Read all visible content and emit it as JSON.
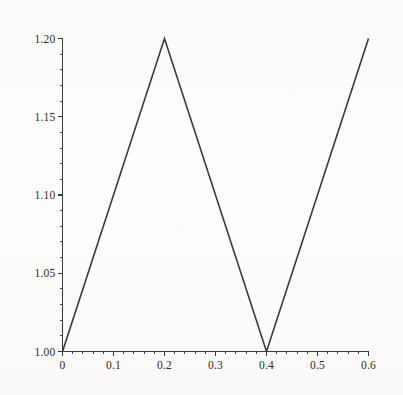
{
  "chart_data": {
    "type": "line",
    "title": "",
    "xlabel": "",
    "ylabel": "",
    "xlim": [
      0,
      0.6
    ],
    "ylim": [
      1.0,
      1.2
    ],
    "grid": false,
    "legend": null,
    "x_ticks": [
      "0",
      "0.1",
      "0.2",
      "0.3",
      "0.4",
      "0.5",
      "0.6"
    ],
    "x_tick_values": [
      0,
      0.1,
      0.2,
      0.3,
      0.4,
      0.5,
      0.6
    ],
    "y_ticks": [
      "1.00",
      "1.05",
      "1.10",
      "1.15",
      "1.20"
    ],
    "y_tick_values": [
      1.0,
      1.05,
      1.1,
      1.15,
      1.2
    ],
    "x_minor_ticks_per_major": 5,
    "y_minor_ticks_per_major": 5,
    "series": [
      {
        "name": "",
        "color": "#3a3a3a",
        "linewidth": 1.6,
        "x": [
          0,
          0.2,
          0.4,
          0.6
        ],
        "values": [
          1.0,
          1.2,
          1.0,
          1.2
        ]
      }
    ],
    "annotations": []
  },
  "axes": {
    "x_axis_name": "x-axis",
    "y_axis_name": "y-axis",
    "axis_color": "#3a3a3a"
  }
}
